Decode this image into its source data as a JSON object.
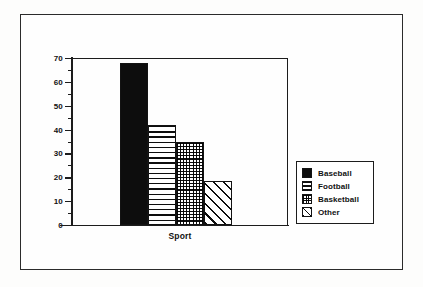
{
  "chart_data": {
    "type": "bar",
    "title": "",
    "xlabel": "Sport",
    "ylabel": "",
    "categories": [
      "Baseball",
      "Football",
      "Basketball",
      "Other"
    ],
    "values": [
      68,
      42,
      35,
      18.5
    ],
    "ylim": [
      0,
      70
    ],
    "y_ticks": [
      70,
      60,
      50,
      40,
      30,
      20,
      10,
      0
    ],
    "y_tick_labels": [
      "70",
      "60",
      "50",
      "40",
      "30",
      "20",
      "10",
      "0"
    ],
    "y_minor_ticks": [
      65,
      55,
      45,
      35,
      25,
      15,
      5
    ],
    "grid": false,
    "legend_position": "right",
    "series": [
      {
        "name": "Baseball",
        "value": 68,
        "pattern": "solid-black",
        "color": "#0d0d0d"
      },
      {
        "name": "Football",
        "value": 42,
        "pattern": "horizontal-lines",
        "color": "#0d0d0d"
      },
      {
        "name": "Basketball",
        "value": 35,
        "pattern": "cross-hatch-grid",
        "color": "#0d0d0d"
      },
      {
        "name": "Other",
        "value": 18.5,
        "pattern": "diagonal-hatch",
        "color": "#0d0d0d"
      }
    ]
  },
  "legend": {
    "items": [
      {
        "label": "Baseball",
        "swatch": "solid-black-swatch"
      },
      {
        "label": "Football",
        "swatch": "horizontal-lines-swatch"
      },
      {
        "label": "Basketball",
        "swatch": "cross-hatch-swatch"
      },
      {
        "label": "Other",
        "swatch": "diagonal-hatch-swatch"
      }
    ]
  },
  "axis": {
    "x_title": "Sport"
  },
  "colors": {
    "ink": "#1c1c1c",
    "fill": "#0d0d0d",
    "paper": "#fefefe"
  }
}
